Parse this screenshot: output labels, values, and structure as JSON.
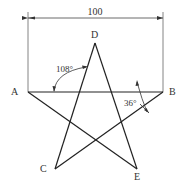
{
  "diagram": {
    "colors": {
      "line": "#222222",
      "text": "#333333",
      "dimension": "#555555",
      "background": "#ffffff"
    },
    "dimension": {
      "label": "100"
    },
    "vertices": {
      "A": {
        "label": "A"
      },
      "B": {
        "label": "B"
      },
      "C": {
        "label": "C"
      },
      "D": {
        "label": "D"
      },
      "E": {
        "label": "E"
      }
    },
    "angles": [
      {
        "label": "108°",
        "at": "upper-left of star"
      },
      {
        "label": "36°",
        "at": "vertex B"
      }
    ]
  }
}
